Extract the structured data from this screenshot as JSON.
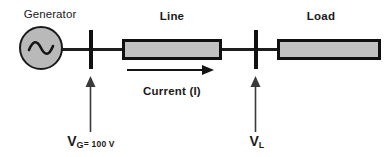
{
  "diagram": {
    "title_hidden": "",
    "colors": {
      "stroke": "#111111",
      "fill_gray": "#c2c2c2",
      "generator_fill": "#b9b9b9",
      "background": "#ffffff"
    },
    "labels": {
      "generator": "Generator",
      "line": "Line",
      "load": "Load",
      "current": "Current (I)"
    },
    "generator": {
      "symbol": "~",
      "symbol_name": "ac-source-sine"
    },
    "measurements": {
      "vg": {
        "symbol": "V",
        "subscript": "G",
        "value_text": "= 100 V",
        "full_text": "VG = 100 V"
      },
      "vl": {
        "symbol": "V",
        "subscript": "L",
        "value_text": "",
        "full_text": "VL"
      }
    }
  }
}
